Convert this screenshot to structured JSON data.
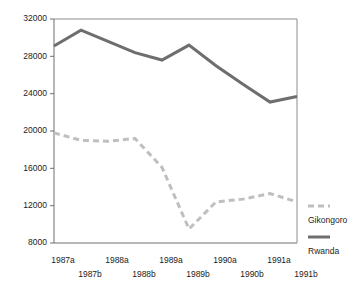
{
  "chart_data": {
    "type": "line",
    "title": "",
    "subtitle": "",
    "xlabel": "",
    "ylabel": "",
    "grid": false,
    "legend_position": "right",
    "categories": [
      "1987a",
      "1987b",
      "1988a",
      "1988b",
      "1989a",
      "1989b",
      "1990a",
      "1990b",
      "1991a",
      "1991b"
    ],
    "ylim": [
      8000,
      32000
    ],
    "yticks": [
      8000,
      12000,
      16000,
      20000,
      24000,
      28000,
      32000
    ],
    "ytick_labels": [
      "8000",
      "12000",
      "16000",
      "20000",
      "24000",
      "28000",
      "32000"
    ],
    "series": [
      {
        "name": "Rwanda",
        "style": "solid",
        "color": "#6e6e6e",
        "values": [
          29100,
          30800,
          29600,
          28400,
          27600,
          29200,
          27000,
          25000,
          23100,
          23700
        ]
      },
      {
        "name": "Gikongoro",
        "style": "dashed",
        "color": "#bfbfbf",
        "values": [
          19800,
          19000,
          18900,
          19200,
          16100,
          9500,
          12400,
          12700,
          13300,
          12400
        ]
      }
    ]
  },
  "legend": {
    "items": [
      {
        "label": "Gikongoro",
        "color": "#bfbfbf",
        "style": "dashed"
      },
      {
        "label": "Rwanda",
        "color": "#6e6e6e",
        "style": "solid"
      }
    ]
  },
  "xaxis": {
    "row_top": [
      "1987a",
      "1988a",
      "1989a",
      "1990a",
      "1991a"
    ],
    "row_bottom": [
      "1987b",
      "1988b",
      "1989b",
      "1990b",
      "1991b"
    ]
  }
}
